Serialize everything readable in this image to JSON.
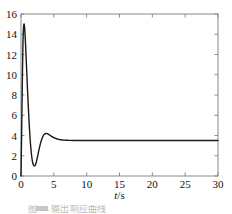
{
  "chart_data": {
    "type": "line",
    "title": "",
    "subtitle": "",
    "xlabel": "t/s",
    "xlabel_italic_part": "t",
    "xlabel_rest": "/s",
    "ylabel": "",
    "xlim": [
      0,
      30
    ],
    "ylim": [
      0,
      16
    ],
    "xticks": [
      0,
      5,
      10,
      15,
      20,
      25,
      30
    ],
    "yticks": [
      0,
      2,
      4,
      6,
      8,
      10,
      12,
      14,
      16
    ],
    "xtick_labels": [
      "0",
      "5",
      "10",
      "15",
      "20",
      "25",
      "30"
    ],
    "ytick_labels": [
      "0",
      "2",
      "4",
      "6",
      "8",
      "10",
      "12",
      "14",
      "16"
    ],
    "grid": false,
    "box": true,
    "tick_direction": "in",
    "legend": null,
    "legend_position": "none",
    "series": [
      {
        "name": "step response",
        "color": "#1a1a1a",
        "linewidth": 1.4,
        "x": [
          0.0,
          0.1,
          0.2,
          0.3,
          0.38,
          0.45,
          0.52,
          0.6,
          0.7,
          0.8,
          0.9,
          1.0,
          1.1,
          1.2,
          1.3,
          1.4,
          1.5,
          1.6,
          1.7,
          1.8,
          1.9,
          2.0,
          2.1,
          2.2,
          2.35,
          2.5,
          2.65,
          2.8,
          3.0,
          3.2,
          3.4,
          3.6,
          3.8,
          4.0,
          4.2,
          4.4,
          4.6,
          4.8,
          5.0,
          5.2,
          5.4,
          5.6,
          5.8,
          6.0,
          6.3,
          6.6,
          7.0,
          7.5,
          8.0,
          9.0,
          10.0,
          12.0,
          14.0,
          16.0,
          18.0,
          20.0,
          22.0,
          24.0,
          26.0,
          28.0,
          30.0
        ],
        "y": [
          0.0,
          4.4,
          9.2,
          13.1,
          14.6,
          15.0,
          14.85,
          14.2,
          12.9,
          11.4,
          9.9,
          8.4,
          7.0,
          5.7,
          4.55,
          3.55,
          2.75,
          2.1,
          1.62,
          1.28,
          1.08,
          1.0,
          1.02,
          1.12,
          1.42,
          1.85,
          2.32,
          2.78,
          3.3,
          3.7,
          3.98,
          4.14,
          4.2,
          4.18,
          4.12,
          4.03,
          3.94,
          3.86,
          3.79,
          3.73,
          3.68,
          3.64,
          3.61,
          3.59,
          3.56,
          3.54,
          3.53,
          3.52,
          3.51,
          3.51,
          3.5,
          3.5,
          3.5,
          3.5,
          3.5,
          3.5,
          3.5,
          3.5,
          3.5,
          3.5,
          3.5
        ],
        "peak_value": 15.0,
        "peak_time": 0.45,
        "min_value": 1.0,
        "min_time": 2.0,
        "overshoot_value": 4.2,
        "overshoot_time": 3.8,
        "steady_state": 3.5
      }
    ]
  },
  "figure": {
    "background_color": "#ffffff",
    "axis_color": "#808080",
    "text_color": "#111111",
    "caption_partial": "图  —  输出响应曲线"
  }
}
